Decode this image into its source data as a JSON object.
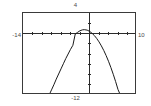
{
  "window": {
    "title": "Graph Viewport"
  },
  "labels": {
    "ymax": "4",
    "ymin": "-12",
    "xmin": "-14",
    "xmax": "10"
  },
  "colors": {
    "frame": "#3a3a3a",
    "axis": "#2b2b2b",
    "curve": "#1a1a1a",
    "label": "#4a4a4a",
    "background": "#ffffff"
  },
  "chart_data": {
    "type": "line",
    "title": "",
    "xlabel": "",
    "ylabel": "",
    "xlim": [
      -14,
      10
    ],
    "ylim": [
      -12,
      4
    ],
    "grid": false,
    "legend": null,
    "axes": {
      "x_axis_at_y": 0,
      "y_axis_at_x": 0,
      "x_tick_spacing": 2,
      "y_tick_spacing": 2,
      "x_ticks": [
        -14,
        -12,
        -10,
        -8,
        -6,
        -4,
        -2,
        0,
        2,
        4,
        6,
        8,
        10
      ],
      "y_ticks": [
        -12,
        -10,
        -8,
        -6,
        -4,
        -2,
        0,
        2,
        4
      ]
    },
    "annotations": [
      {
        "text": "4",
        "position": "top",
        "meaning": "y-axis maximum"
      },
      {
        "text": "-12",
        "position": "bottom",
        "meaning": "y-axis minimum"
      },
      {
        "text": "-14",
        "position": "left",
        "meaning": "x-axis minimum"
      },
      {
        "text": "10",
        "position": "right",
        "meaning": "x-axis maximum"
      }
    ],
    "series": [
      {
        "name": "parabola",
        "shape": "downward parabola",
        "vertex": [
          -1.1,
          0.75
        ],
        "equation": "y = -0.26 (x + 1.1)^2 + 0.75",
        "x": [
          -8.5,
          -8.0,
          -7.5,
          -7.0,
          -6.5,
          -6.0,
          -5.5,
          -5.0,
          -4.5,
          -4.0,
          -3.5,
          -3.0,
          -2.5,
          -2.0,
          -1.5,
          -1.1,
          -0.5,
          0.0,
          0.5,
          1.0,
          1.5,
          2.0,
          2.5,
          3.0,
          3.5,
          4.0,
          4.5,
          5.0,
          5.5,
          6.0,
          6.5
        ],
        "y": [
          -12.0,
          -11.0,
          -10.0,
          -8.9,
          -7.9,
          -6.9,
          -5.9,
          -4.9,
          -4.0,
          -3.1,
          -2.3,
          -0.1,
          0.23,
          0.54,
          0.71,
          0.75,
          0.66,
          0.43,
          0.08,
          -0.38,
          -0.95,
          -1.63,
          -2.42,
          -3.31,
          -4.31,
          -5.42,
          -6.64,
          -7.96,
          -9.39,
          -10.93,
          -12.0
        ]
      }
    ]
  }
}
